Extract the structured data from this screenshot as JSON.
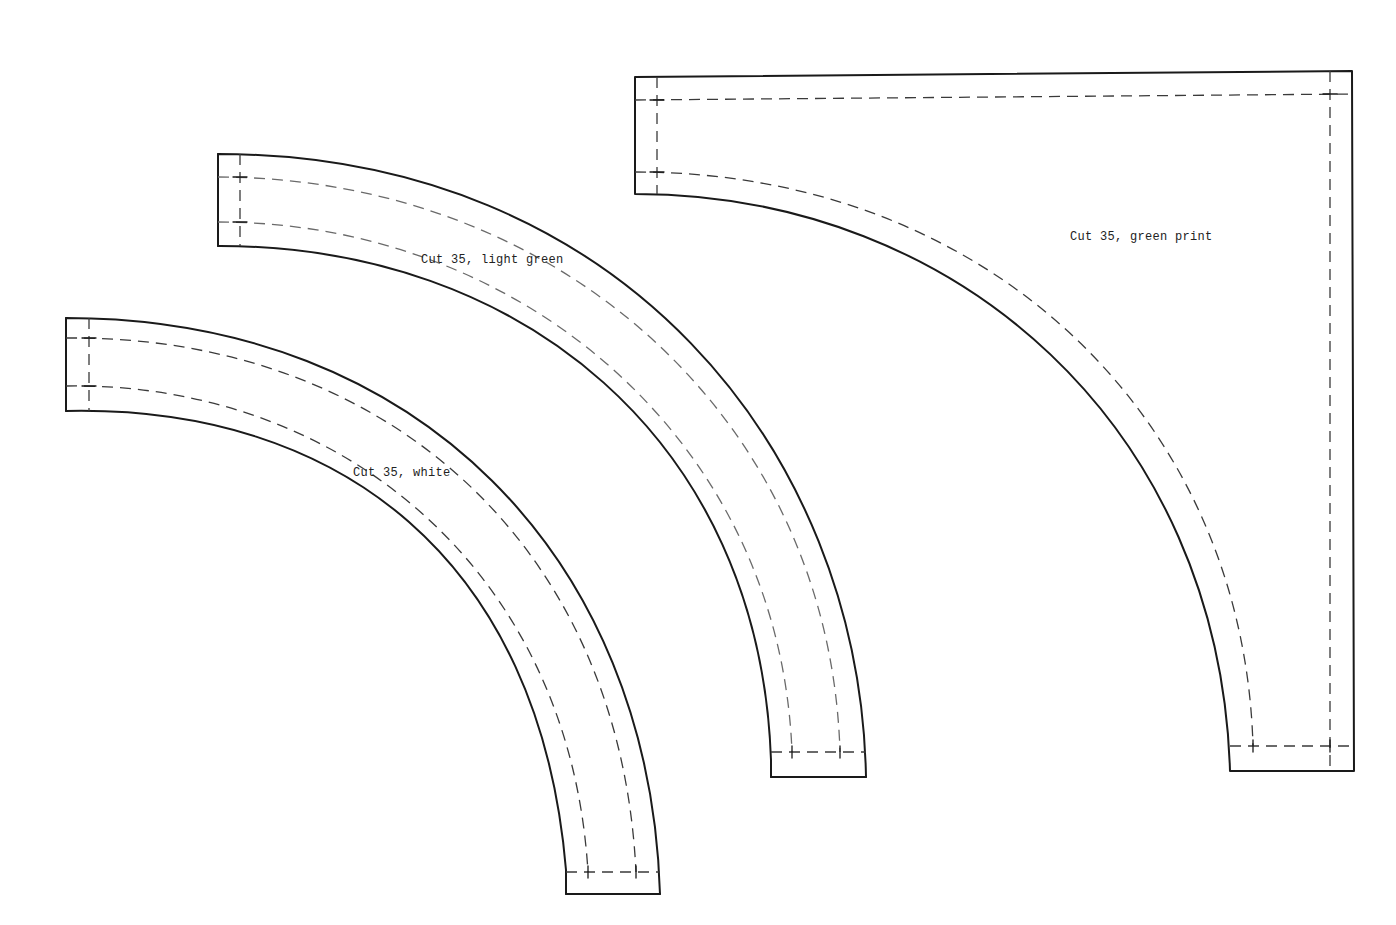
{
  "diagram": {
    "type": "quilt-pattern-templates",
    "line_legend": {
      "solid": "cutting line",
      "dashed": "seam line"
    },
    "colors": {
      "line": "#1a1a1a",
      "seam": "#3a3a3a",
      "background": "#ffffff"
    },
    "pieces": [
      {
        "id": "white",
        "label": "Cut 35, white",
        "shape": "quarter-arc band (innermost)"
      },
      {
        "id": "light-green",
        "label": "Cut 35, light green",
        "shape": "quarter-arc band (middle)"
      },
      {
        "id": "green-print",
        "label": "Cut 35, green print",
        "shape": "corner piece with concave arc"
      }
    ]
  }
}
